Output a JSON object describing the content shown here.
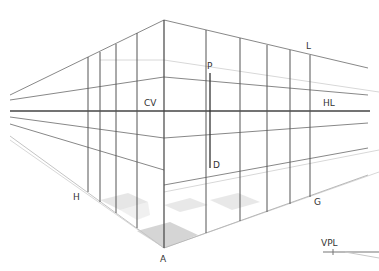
{
  "diagram": {
    "colors": {
      "background": "#ffffff",
      "line": "#555555",
      "line_light": "#999999",
      "line_faint": "#d0d0d0",
      "horizon": "#444444",
      "floor_tile": "#c8c8c8",
      "label": "#333333"
    },
    "labels": {
      "cv": "CV",
      "hl": "HL",
      "l": "L",
      "p": "P",
      "d": "D",
      "h": "H",
      "g": "G",
      "a": "A",
      "vpl": "VPL"
    },
    "points": {
      "corner_top": [
        164,
        20
      ],
      "corner_bottom_A": [
        164,
        248
      ],
      "horizon_y": 111
    },
    "left_verticals_x": [
      88,
      100,
      116,
      137
    ],
    "right_verticals_x": [
      206,
      240,
      267,
      290,
      310
    ],
    "pd_line_x": 210
  }
}
